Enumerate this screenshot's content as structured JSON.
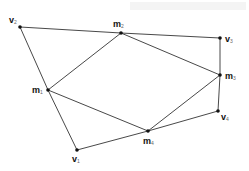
{
  "diagram": {
    "type": "polygon-with-midpoint-quadrilateral",
    "colors": {
      "line": "#333333",
      "point": "#111111",
      "background": "#ffffff"
    },
    "points": [
      {
        "id": "v1",
        "letter": "v",
        "sub": "1",
        "x": 77,
        "y": 150,
        "lx": 72,
        "ly": 155
      },
      {
        "id": "v2",
        "letter": "v",
        "sub": "2",
        "x": 20,
        "y": 27,
        "lx": 9,
        "ly": 16
      },
      {
        "id": "v3",
        "letter": "v",
        "sub": "3",
        "x": 220,
        "y": 38,
        "lx": 225,
        "ly": 35
      },
      {
        "id": "v4",
        "letter": "v",
        "sub": "4",
        "x": 218,
        "y": 111,
        "lx": 221,
        "ly": 113
      },
      {
        "id": "m1",
        "letter": "m",
        "sub": "1",
        "x": 48,
        "y": 90,
        "lx": 32,
        "ly": 86
      },
      {
        "id": "m2",
        "letter": "m",
        "sub": "2",
        "x": 121,
        "y": 33,
        "lx": 113,
        "ly": 20
      },
      {
        "id": "m3",
        "letter": "m",
        "sub": "3",
        "x": 220,
        "y": 75,
        "lx": 225,
        "ly": 72
      },
      {
        "id": "m4",
        "letter": "m",
        "sub": "4",
        "x": 148,
        "y": 131,
        "lx": 143,
        "ly": 137
      }
    ],
    "outer_edges": [
      [
        "v2",
        "m2"
      ],
      [
        "m2",
        "v3"
      ],
      [
        "v3",
        "m3"
      ],
      [
        "m3",
        "v4"
      ],
      [
        "v4",
        "m4"
      ],
      [
        "m4",
        "v1"
      ],
      [
        "v1",
        "m1"
      ],
      [
        "m1",
        "v2"
      ]
    ],
    "inner_edges": [
      [
        "m1",
        "m2"
      ],
      [
        "m2",
        "m3"
      ],
      [
        "m3",
        "m4"
      ],
      [
        "m4",
        "m1"
      ]
    ]
  }
}
